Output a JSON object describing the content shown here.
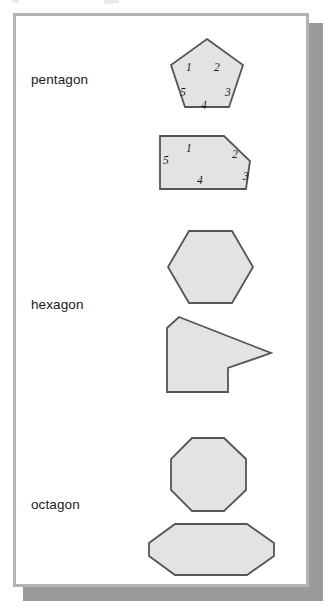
{
  "figure": {
    "title": "",
    "background_color": "#ffffff",
    "frame_color": "#b4b4b4",
    "shadow_color": "#9a9a9a",
    "shape_fill": "#e3e3e3",
    "shape_stroke": "#555555"
  },
  "rows": [
    {
      "label": "pentagon"
    },
    {
      "label": "hexagon"
    },
    {
      "label": "octagon"
    }
  ],
  "shapes": [
    {
      "name": "regular-pentagon",
      "group": "pentagon",
      "sides": 5,
      "convex": true,
      "points": "207,39 243,65 229,107 185,107 171,65"
    },
    {
      "name": "irregular-pentagon",
      "group": "pentagon",
      "sides": 5,
      "convex": true,
      "points": "160,136 224,136 250,161 246,189 160,189"
    },
    {
      "name": "regular-hexagon",
      "group": "hexagon",
      "sides": 6,
      "convex": true,
      "points": "189,231 232,231 253,267 232,303 189,303 168,267"
    },
    {
      "name": "concave-hexagon",
      "group": "hexagon",
      "sides": 6,
      "convex": false,
      "points": "179,317 271,353 228,368 228,392 167,392 167,328"
    },
    {
      "name": "regular-octagon",
      "group": "octagon",
      "sides": 8,
      "convex": true,
      "points": "192,438 224,438 246,459 246,490 224,511 192,511 171,490 171,459"
    },
    {
      "name": "elongated-octagon",
      "group": "octagon",
      "sides": 8,
      "convex": true,
      "points": "175,524 247,524 274,543 274,556 247,575 175,575 149,556 149,543"
    }
  ],
  "side_numbers": {
    "regular-pentagon": [
      {
        "value": "1",
        "x": 186,
        "y": 61
      },
      {
        "value": "2",
        "x": 214,
        "y": 61
      },
      {
        "value": "3",
        "x": 225,
        "y": 86
      },
      {
        "value": "4",
        "x": 201,
        "y": 99
      },
      {
        "value": "5",
        "x": 180,
        "y": 86
      }
    ],
    "irregular-pentagon": [
      {
        "value": "1",
        "x": 186,
        "y": 142
      },
      {
        "value": "2",
        "x": 232,
        "y": 148
      },
      {
        "value": "3",
        "x": 243,
        "y": 170
      },
      {
        "value": "4",
        "x": 197,
        "y": 174
      },
      {
        "value": "5",
        "x": 163,
        "y": 154
      }
    ]
  }
}
